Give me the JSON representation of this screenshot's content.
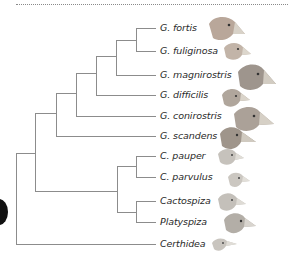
{
  "diagram": {
    "type": "phylogenetic-tree",
    "line_color": "#8c8c8c",
    "taxa": [
      {
        "label": "G. fortis",
        "y": 28,
        "bird_size": "large"
      },
      {
        "label": "G. fuliginosa",
        "y": 51,
        "bird_size": "small"
      },
      {
        "label": "G. magnirostris",
        "y": 75,
        "bird_size": "large"
      },
      {
        "label": "G. difficilis",
        "y": 95,
        "bird_size": "small"
      },
      {
        "label": "G. conirostris",
        "y": 116,
        "bird_size": "large"
      },
      {
        "label": "G. scandens",
        "y": 136,
        "bird_size": "medium"
      },
      {
        "label": "C. pauper",
        "y": 156,
        "bird_size": "small"
      },
      {
        "label": "C. parvulus",
        "y": 177,
        "bird_size": "small"
      },
      {
        "label": "Cactospiza",
        "y": 201,
        "bird_size": "medium"
      },
      {
        "label": "Platyspiza",
        "y": 222,
        "bird_size": "medium"
      },
      {
        "label": "Certhidea",
        "y": 244,
        "bird_size": "small"
      }
    ]
  }
}
